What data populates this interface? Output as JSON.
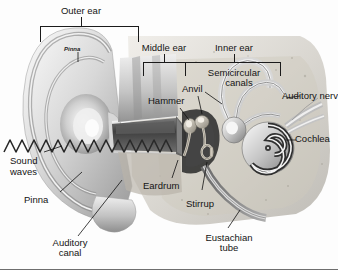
{
  "figure": {
    "type": "anatomical-diagram",
    "clipped_header_text": "",
    "background_color": "#fdfdfd",
    "label_color": "#141414"
  },
  "brackets": [
    {
      "id": "outer-ear",
      "label": "Outer ear"
    },
    {
      "id": "middle-ear",
      "label": "Middle ear"
    },
    {
      "id": "inner-ear",
      "label": "Inner ear"
    }
  ],
  "labels": {
    "outer_ear": "Outer ear",
    "middle_ear": "Middle ear",
    "inner_ear": "Inner ear",
    "pinna_inner": "Pinna",
    "semicircular_line1": "Semicircular",
    "semicircular_line2": "canals",
    "anvil": "Anvil",
    "hammer": "Hammer",
    "auditory_nerve": "Auditory nerv",
    "cochlea": "Cochlea",
    "sound_line1": "Sound",
    "sound_line2": "waves",
    "pinna": "Pinna",
    "eardrum": "Eardrum",
    "stirrup": "Stirrup",
    "auditory_canal_line1": "Auditory",
    "auditory_canal_line2": "canal",
    "eustachian_line1": "Eustachian",
    "eustachian_line2": "tube"
  }
}
